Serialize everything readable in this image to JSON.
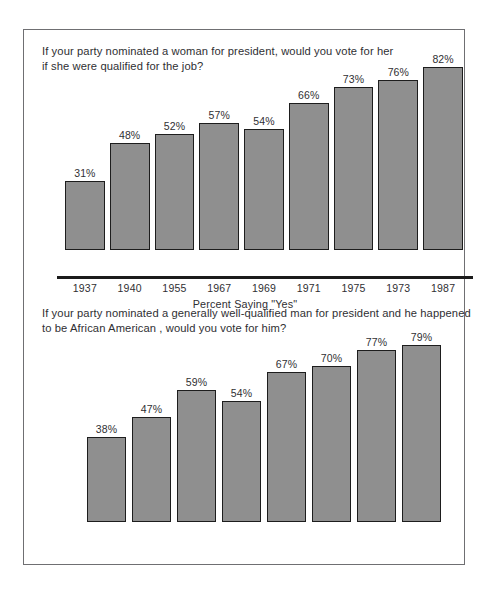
{
  "chart_data": [
    {
      "type": "bar",
      "id": "women",
      "title": "If your party nominated a woman for president, would you vote for her if she were qualified for the job?",
      "title_lines": [
        "If your party nominated a woman for president, would you vote for her",
        "if she were qualified for the job?"
      ],
      "xlabel": "Percent Saying \"Yes\"",
      "ylabel": "",
      "ylim": [
        0,
        100
      ],
      "grid": false,
      "legend": "none",
      "categories": [
        "1937",
        "1940",
        "1955",
        "1967",
        "1969",
        "1971",
        "1975",
        "1973",
        "1987"
      ],
      "values": [
        31,
        48,
        52,
        57,
        54,
        66,
        73,
        76,
        82
      ],
      "value_labels": [
        "31%",
        "48%",
        "52%",
        "57%",
        "54%",
        "66%",
        "73%",
        "76%",
        "82%"
      ],
      "bar_color": "#8f8f8f",
      "bar_border_color": "#1d1d1d",
      "axis_color": "#1b1b1b"
    },
    {
      "type": "bar",
      "id": "african-american",
      "title": "If your party nominated a generally well-qualified man for president and he happened to be African American , would you vote for him?",
      "title_lines": [
        "If your party nominated a generally well-qualified man for president and he happened",
        "to be African American , would you vote for him?"
      ],
      "xlabel": "Percent Saying \"Yes\"",
      "ylabel": "",
      "ylim": [
        0,
        100
      ],
      "grid": false,
      "legend": "none",
      "categories": [
        "1958",
        "1963",
        "1965",
        "1967",
        "1969",
        "1971",
        "1978",
        "1987"
      ],
      "values": [
        38,
        47,
        59,
        54,
        67,
        70,
        77,
        79
      ],
      "value_labels": [
        "38%",
        "47%",
        "59%",
        "54%",
        "67%",
        "70%",
        "77%",
        "79%"
      ],
      "bar_color": "#8f8f8f",
      "bar_border_color": "#1d1d1d",
      "axis_color": "#1b1b1b"
    }
  ]
}
